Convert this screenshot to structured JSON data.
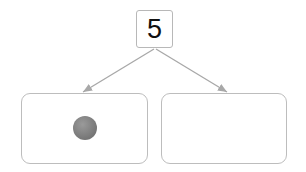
{
  "diagram": {
    "type": "number-bond",
    "whole": {
      "value": "5"
    },
    "parts": [
      {
        "id": "left",
        "content": "1 ball",
        "ball_count": 1
      },
      {
        "id": "right",
        "content": "empty",
        "ball_count": 0
      }
    ],
    "colors": {
      "border": "#bdbdbd",
      "arrow": "#a8a8a8",
      "ball": "#7e7e7e",
      "text": "#111111"
    }
  }
}
